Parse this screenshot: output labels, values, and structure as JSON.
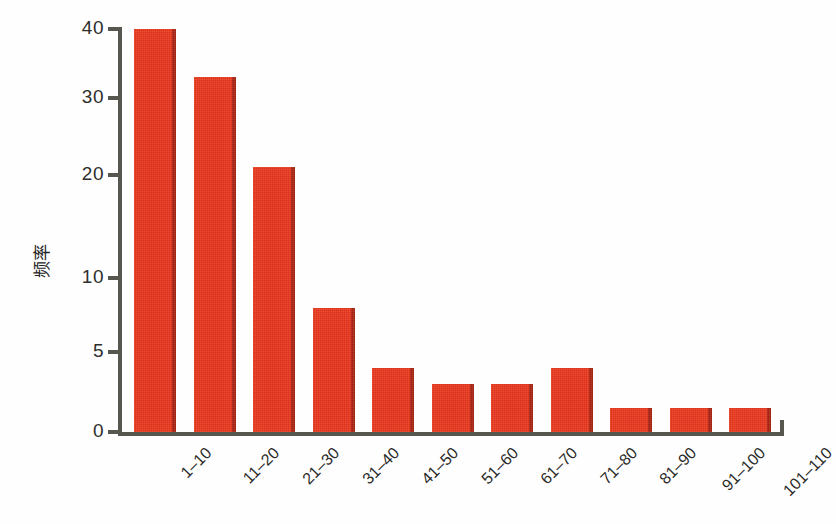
{
  "chart_data": {
    "type": "bar",
    "title": "",
    "xlabel": "",
    "ylabel": "频率",
    "categories": [
      "1–10",
      "11–20",
      "21–30",
      "31–40",
      "41–50",
      "51–60",
      "61–70",
      "71–80",
      "81–90",
      "91–100",
      "101–110"
    ],
    "values": [
      41,
      33,
      21,
      8,
      4,
      3,
      3,
      4,
      1.5,
      1.5,
      1.5
    ],
    "y_ticks": [
      0,
      5,
      10,
      20,
      30,
      40
    ],
    "y_tick_labels": [
      "0",
      "5",
      "10",
      "20",
      "30",
      "40"
    ],
    "ylim": [
      0,
      41
    ],
    "axis_scale": "non-linear (piecewise: 0,5,10,20,30,40 unequally spaced)",
    "grid": false,
    "legend": null,
    "legend_position": "none",
    "bar_color": "#e8321b",
    "axis_color": "#57564f",
    "background_color": "#fefefe",
    "x_label_rotation_deg": -45
  },
  "layout": {
    "y_tick_pixel_y": [
      432,
      352,
      278,
      175,
      98,
      29
    ],
    "bar_pixel_top": [
      23,
      85,
      173,
      300,
      360,
      377,
      377,
      360,
      409,
      409,
      409
    ],
    "bar_width_px": 42,
    "bar_pitch_px": 59.5,
    "plot_left_px": 122,
    "baseline_px": 432
  }
}
